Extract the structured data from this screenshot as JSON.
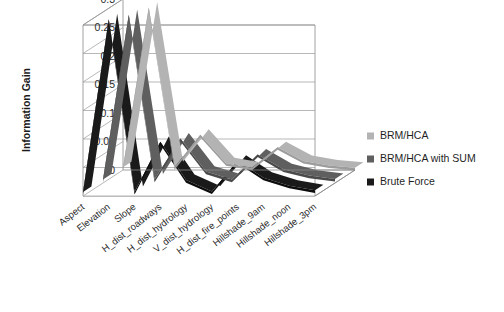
{
  "chart_data": {
    "type": "line",
    "render_style": "3d-ribbon",
    "title": "",
    "xlabel": "",
    "ylabel": "Information Gain",
    "ylim": [
      0,
      0.3
    ],
    "yticks": [
      "0",
      "0.05",
      "0.1",
      "0.15",
      "0.2",
      "0.25",
      "0.3"
    ],
    "ytick_values": [
      0,
      0.05,
      0.1,
      0.15,
      0.2,
      0.25,
      0.3
    ],
    "grid": true,
    "legend_position": "right",
    "categories": [
      "Aspect",
      "Elevation",
      "Slope",
      "H_dist_roadways",
      "H_dist_hydrology",
      "V_dist_hydrology",
      "H_dist_fire_points",
      "Hillshade_9am",
      "Hillshade_noon",
      "Hillshade_3pm"
    ],
    "series": [
      {
        "name": "BRM/HCA",
        "color": "#b3b3b3",
        "side_color": "#9d9d9d",
        "values": [
          0.005,
          0.285,
          0.005,
          0.062,
          0.012,
          0.004,
          0.04,
          0.016,
          0.008,
          0.004
        ]
      },
      {
        "name": "BRM/HCA with SUM",
        "color": "#5f5f5f",
        "side_color": "#4a4a4a",
        "values": [
          0.006,
          0.295,
          0.006,
          0.078,
          0.02,
          0.006,
          0.05,
          0.024,
          0.013,
          0.007
        ]
      },
      {
        "name": "Brute Force",
        "color": "#1a1a1a",
        "side_color": "#0d0d0d",
        "values": [
          0.007,
          0.31,
          0.007,
          0.095,
          0.028,
          0.008,
          0.062,
          0.032,
          0.018,
          0.01
        ]
      }
    ]
  },
  "legend": {
    "items": [
      {
        "label": "BRM/HCA",
        "color": "#b3b3b3"
      },
      {
        "label": "BRM/HCA with SUM",
        "color": "#5f5f5f"
      },
      {
        "label": "Brute Force",
        "color": "#1a1a1a"
      }
    ]
  },
  "axes": {
    "y_title": "Information Gain"
  }
}
